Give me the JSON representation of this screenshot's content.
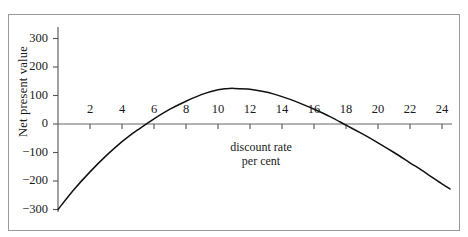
{
  "page": {
    "top_caption": "",
    "background": "#ffffff",
    "ink_color": "#1a1a1a",
    "frame_color": "#9a9a9a"
  },
  "chart_data": {
    "type": "line",
    "title": "",
    "xlabel": "discount rate per cent",
    "xlabel_line1": "discount rate",
    "xlabel_line2": "per cent",
    "ylabel": "Net present value",
    "xlim": [
      0,
      26
    ],
    "ylim": [
      -300,
      300
    ],
    "xticks": [
      2,
      4,
      6,
      8,
      10,
      12,
      14,
      16,
      18,
      20,
      22,
      24
    ],
    "xtick_labels": [
      "2",
      "4",
      "6",
      "8",
      "10",
      "12",
      "14",
      "16",
      "18",
      "20",
      "22",
      "24"
    ],
    "yticks": [
      300,
      200,
      100,
      0,
      -100,
      -200,
      -300
    ],
    "ytick_labels": [
      "300",
      "200",
      "100",
      "0",
      "−100",
      "−200",
      "−300"
    ],
    "grid": false,
    "legend": null,
    "series": [
      {
        "name": "Net present value",
        "color": "#111111",
        "x": [
          0,
          1,
          2,
          3,
          4,
          4.5,
          5,
          6,
          7,
          8,
          9,
          10,
          10.5,
          11,
          12,
          13,
          14,
          15,
          16,
          17,
          18,
          19,
          19.2,
          20,
          21,
          22,
          23,
          24,
          24.5
        ],
        "values": [
          -300,
          -230,
          -168,
          -112,
          -62,
          -40,
          -20,
          18,
          52,
          80,
          104,
          120,
          124,
          125,
          122,
          112,
          96,
          76,
          52,
          26,
          -4,
          -34,
          -40,
          -66,
          -100,
          -136,
          -172,
          -210,
          -228
        ]
      }
    ],
    "annotations": [
      {
        "label": "first zero crossing",
        "x": 4.5,
        "y": 0
      },
      {
        "label": "peak",
        "x": 10.8,
        "y": 125
      },
      {
        "label": "second zero crossing (IRR)",
        "x": 19.0,
        "y": 0
      }
    ]
  }
}
